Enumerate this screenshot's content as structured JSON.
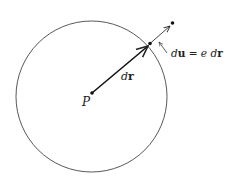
{
  "diagram": {
    "circle": {
      "cx": 91.5,
      "cy": 96.5,
      "r": 75.5,
      "stroke": "#444444"
    },
    "center_point": {
      "label": "P",
      "x": 92,
      "y": 93
    },
    "boundary_point": {
      "x": 150,
      "y": 43.5
    },
    "outer_point": {
      "x": 172.5,
      "y": 23
    },
    "vectors": [
      {
        "name": "dr",
        "label_italic": "d",
        "label_bold": "r"
      },
      {
        "name": "du",
        "label_italic": "d",
        "label_bold": "u"
      }
    ],
    "labels": {
      "P": "P",
      "dr_d": "d",
      "dr_r": "r",
      "du_d": "d",
      "du_u": "u",
      "eq": " = ",
      "e": "e",
      "eq_d": " d",
      "eq_r": "r"
    }
  }
}
